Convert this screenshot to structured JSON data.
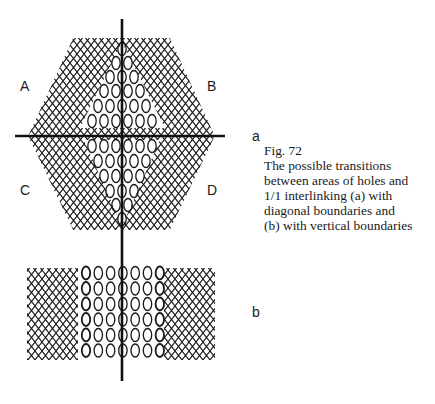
{
  "figure": {
    "number_label": "Fig. 72",
    "caption_lines": [
      "The possible transitions",
      "between areas of holes and",
      "1/1 interlinking (a) with",
      "diagonal boundaries and",
      "(b) with vertical boundaries"
    ]
  },
  "panel_a": {
    "label": "a",
    "quadrant_labels": {
      "A": "A",
      "B": "B",
      "C": "C",
      "D": "D"
    },
    "description": "Hexagonal net with central triangular areas of holes, divided by vertical and horizontal axes"
  },
  "panel_b": {
    "label": "b",
    "description": "Rectangular net with central vertical band of holes between interlinked areas"
  },
  "colors": {
    "ink": "#1a1a1a",
    "background": "#ffffff"
  }
}
